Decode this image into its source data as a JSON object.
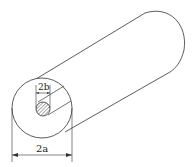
{
  "figure": {
    "inner_diameter_label": "2b",
    "outer_diameter_label": "2a",
    "colors": {
      "stroke": "#333333",
      "hatch": "#555555",
      "background": "#ffffff"
    }
  }
}
